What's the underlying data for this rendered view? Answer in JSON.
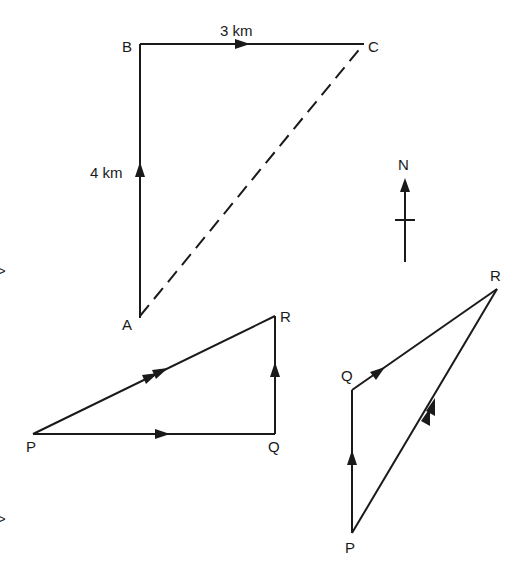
{
  "diagram": {
    "figure1": {
      "points": {
        "A": "A",
        "B": "B",
        "C": "C"
      },
      "label_ab": "4 km",
      "label_bc": "3 km"
    },
    "compass": {
      "north_label": "N"
    },
    "figure2": {
      "points": {
        "P": "P",
        "Q": "Q",
        "R": "R"
      }
    },
    "figure3": {
      "points": {
        "P": "P",
        "Q": "Q",
        "R": "R"
      }
    },
    "margin_marks": [
      ">",
      ">"
    ]
  }
}
